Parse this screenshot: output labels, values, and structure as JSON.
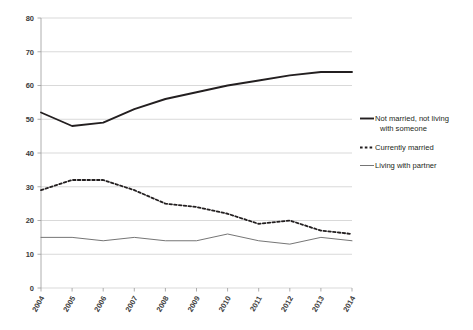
{
  "chart_data": {
    "type": "line",
    "title": "",
    "xlabel": "",
    "ylabel": "",
    "categories": [
      "2004",
      "2005",
      "2006",
      "2007",
      "2008",
      "2009",
      "2010",
      "2011",
      "2012",
      "2013",
      "2014"
    ],
    "x": [
      2004,
      2005,
      2006,
      2007,
      2008,
      2009,
      2010,
      2011,
      2012,
      2013,
      2014
    ],
    "ylim": [
      0,
      80
    ],
    "yticks": [
      0,
      10,
      20,
      30,
      40,
      50,
      60,
      70,
      80
    ],
    "grid": "horizontal",
    "legend_position": "right",
    "series": [
      {
        "name": "Not married, not living with someone",
        "style": "solid-thick",
        "color": "#231f20",
        "values": [
          52,
          48,
          49,
          53,
          56,
          58,
          60,
          61.5,
          63,
          64,
          64
        ]
      },
      {
        "name": "Currently married",
        "style": "dashed",
        "color": "#231f20",
        "values": [
          29,
          32,
          32,
          29,
          25,
          24,
          22,
          19,
          20,
          17,
          16
        ]
      },
      {
        "name": "Living with partner",
        "style": "solid-thin",
        "color": "#6e6e6e",
        "values": [
          15,
          15,
          14,
          15,
          14,
          14,
          16,
          14,
          13,
          15,
          14
        ]
      }
    ]
  },
  "legend": {
    "entries": [
      {
        "label_line1": "Not married, not living",
        "label_line2": "with someone",
        "marker": "solid-thick-line-marker"
      },
      {
        "label_line1": "Currently married",
        "label_line2": "",
        "marker": "dashed-line-marker"
      },
      {
        "label_line1": "Living with partner",
        "label_line2": "",
        "marker": "solid-thin-line-marker"
      }
    ]
  },
  "axes": {
    "y_labels": [
      "80",
      "70",
      "60",
      "50",
      "40",
      "30",
      "20",
      "10",
      "0"
    ],
    "x_labels": [
      "2004",
      "2005",
      "2006",
      "2007",
      "2008",
      "2009",
      "2010",
      "2011",
      "2012",
      "2013",
      "2014"
    ]
  }
}
